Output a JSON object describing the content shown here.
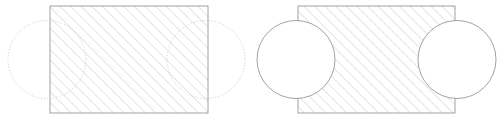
{
  "document": {
    "title": "Boolean Operation Diagram",
    "width": 504,
    "height": 121,
    "background_color": "#ffffff",
    "description": "Two side-by-side line drawings illustrating a boolean geometry operation: a hatched rectangle with two overlapping construction circles (left), and the resulting profile where the circle regions are cleared of hatching and drawn with solid outlines (right)."
  },
  "style": {
    "hatch_color": "#b3b3b3",
    "hatch_angle_deg": 45,
    "hatch_spacing": 7.5,
    "hatch_stroke_width": 0.7,
    "outline_color": "#8c8c8c",
    "outline_stroke_width": 0.8,
    "construction_color": "#b5b5b5",
    "construction_stroke_width": 0.7,
    "construction_dash": "1,2",
    "fill_color": "#ffffff"
  },
  "figures": [
    {
      "id": "figure-before",
      "name": "before-boolean",
      "label": "Rectangle with overlapping construction circles",
      "rectangle": {
        "name": "hatched-rectangle",
        "x": 50,
        "y": 6,
        "width": 158,
        "height": 107,
        "hatched": true,
        "outline": "solid"
      },
      "circles": [
        {
          "name": "left-construction-circle",
          "cx": 47,
          "cy": 59.5,
          "r": 39,
          "outline": "dotted",
          "filled": false,
          "hatched_through": true
        },
        {
          "name": "right-construction-circle",
          "cx": 206,
          "cy": 59.5,
          "r": 39,
          "outline": "dotted",
          "filled": false,
          "hatched_through": true
        }
      ]
    },
    {
      "id": "figure-after",
      "name": "after-boolean",
      "label": "Resulting profile with circle regions cleared",
      "rectangle": {
        "name": "hatched-rectangle",
        "x": 298,
        "y": 6,
        "width": 157,
        "height": 107,
        "hatched": true,
        "outline": "solid"
      },
      "circles": [
        {
          "name": "left-result-circle",
          "cx": 296,
          "cy": 59.5,
          "r": 39,
          "outline": "solid",
          "filled": true,
          "hatched_through": false
        },
        {
          "name": "right-result-circle",
          "cx": 457,
          "cy": 59.5,
          "r": 39,
          "outline": "solid",
          "filled": true,
          "hatched_through": false
        }
      ]
    }
  ]
}
